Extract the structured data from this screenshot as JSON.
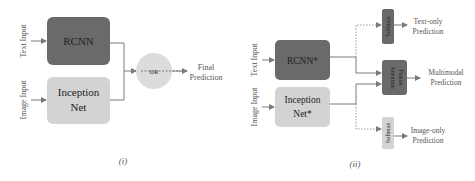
{
  "colors": {
    "dark_box": "#6a6a6a",
    "light_box": "#d3d3d3",
    "or_circle": "#dcdcdc",
    "line": "#7a7a7a"
  },
  "diagram_i": {
    "caption": "(i)",
    "text_input_label": "Text Input",
    "image_input_label": "Image Input",
    "text_model": "RCNN",
    "image_model_line1": "Inception",
    "image_model_line2": "Net",
    "combiner": "OR",
    "output_line1": "Final",
    "output_line2": "Prediction"
  },
  "diagram_ii": {
    "caption": "(ii)",
    "text_input_label": "Text Input",
    "image_input_label": "Image Input",
    "text_model": "RCNN*",
    "image_model_line1": "Inception",
    "image_model_line2": "Net*",
    "top_head": "Softmax",
    "top_output_line1": "Text-only",
    "top_output_line2": "Prediction",
    "fusion_line1": "Attention",
    "fusion_line2": "Fusion",
    "mid_output_line1": "Multimodal",
    "mid_output_line2": "Prediction",
    "bottom_head": "Softmax",
    "bottom_output_line1": "Image-only",
    "bottom_output_line2": "Prediction"
  }
}
